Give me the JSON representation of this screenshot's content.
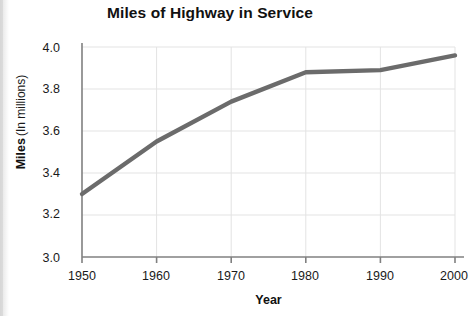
{
  "chart_data": {
    "type": "line",
    "title": "Miles of Highway in Service",
    "xlabel": "Year",
    "ylabel": "Miles",
    "ylabel_sub": "(In millions)",
    "x": [
      1950,
      1960,
      1970,
      1980,
      1990,
      2000
    ],
    "values": [
      3.3,
      3.55,
      3.74,
      3.88,
      3.89,
      3.96
    ],
    "categories": [
      "1950",
      "1960",
      "1970",
      "1980",
      "1990",
      "2000"
    ],
    "xtick_labels": [
      "1950",
      "1960",
      "1970",
      "1980",
      "1990",
      "2000"
    ],
    "ytick_labels": [
      "3.0",
      "3.2",
      "3.4",
      "3.6",
      "3.8",
      "4.0"
    ],
    "ytick_values": [
      3.0,
      3.2,
      3.4,
      3.6,
      3.8,
      4.0
    ],
    "xlim": [
      1950,
      2000
    ],
    "ylim": [
      3.0,
      4.0
    ],
    "grid": true,
    "legend": false,
    "series_color": "#6b6b6b",
    "grid_color": "#e3e3e3",
    "axis_color": "#808080"
  }
}
